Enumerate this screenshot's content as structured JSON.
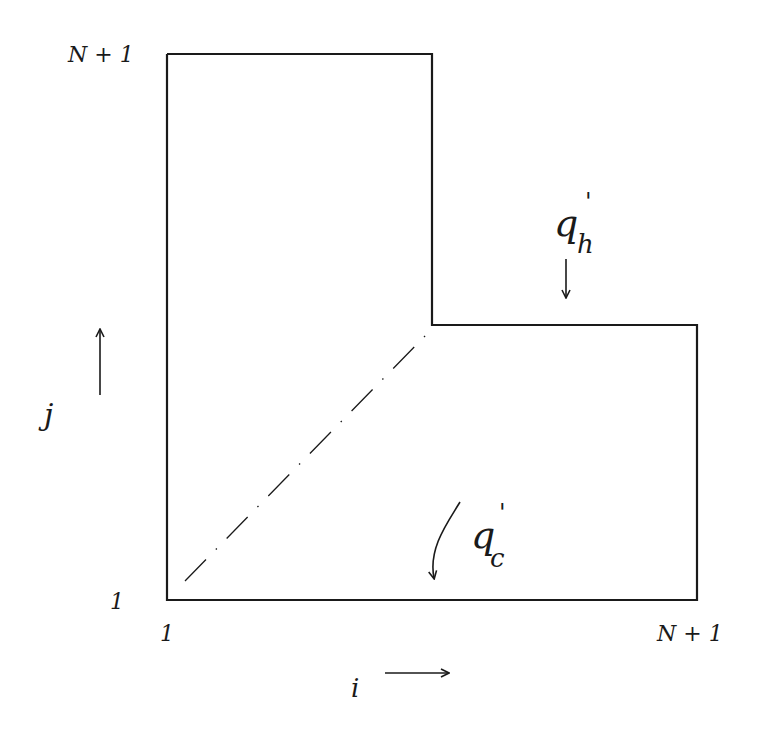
{
  "diagram": {
    "type": "L-shaped domain sketch (hand-drawn)",
    "colors": {
      "stroke": "#1a1a1a",
      "background": "#ffffff"
    },
    "labels": {
      "top_left_j": "N + 1",
      "bottom_left_j": "1",
      "bottom_left_i": "1",
      "bottom_right_i": "N + 1",
      "i_axis": "i",
      "j_axis": "j",
      "q_h_main": "q",
      "q_h_prime": "'",
      "q_h_sub": "h",
      "q_c_main": "q",
      "q_c_prime": "'",
      "q_c_sub": "c"
    },
    "shape": {
      "outline_points": [
        [
          167,
          54
        ],
        [
          432,
          54
        ],
        [
          432,
          325
        ],
        [
          697,
          325
        ],
        [
          697,
          600
        ],
        [
          167,
          600
        ]
      ],
      "diagonal_dash_dot": {
        "from": [
          185,
          581
        ],
        "to": [
          428,
          333
        ]
      }
    },
    "arrows": {
      "i_direction": "right",
      "j_direction": "up",
      "q_h_flux": "down onto top boundary of lower-right arm",
      "q_c_flux": "curved arrow down onto bottom boundary"
    }
  }
}
